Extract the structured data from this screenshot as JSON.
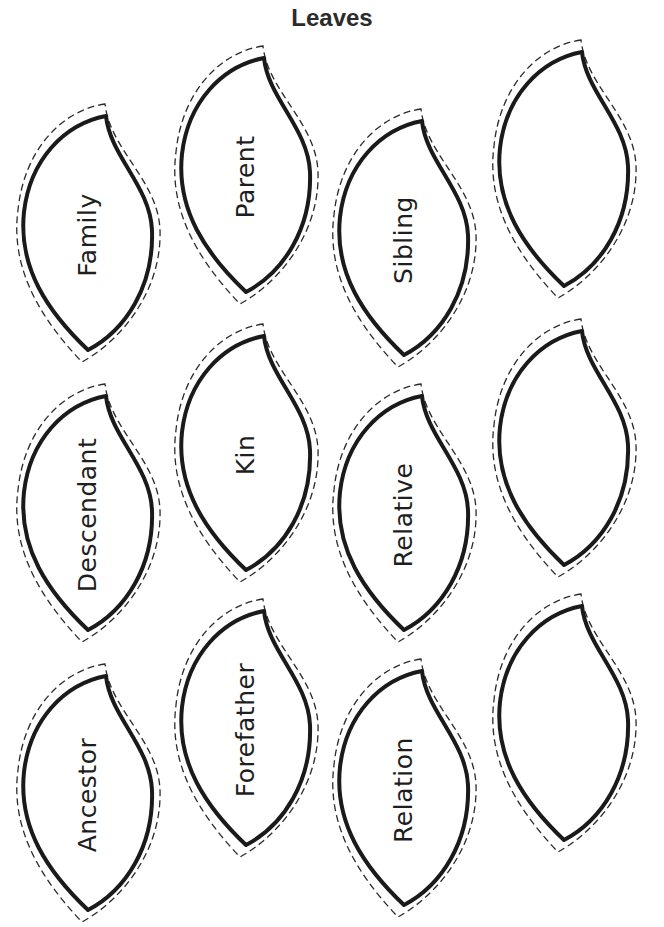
{
  "page": {
    "title": "Leaves"
  },
  "colors": {
    "outline": "#1a1a1a",
    "cut_line": "#2a2a2a",
    "background": "#ffffff"
  },
  "leaves": [
    {
      "label": "Family",
      "row": 1,
      "col": 1
    },
    {
      "label": "Parent",
      "row": 1,
      "col": 2
    },
    {
      "label": "Sibling",
      "row": 1,
      "col": 3
    },
    {
      "label": "",
      "row": 1,
      "col": 4
    },
    {
      "label": "Descendant",
      "row": 2,
      "col": 1
    },
    {
      "label": "Kin",
      "row": 2,
      "col": 2
    },
    {
      "label": "Relative",
      "row": 2,
      "col": 3
    },
    {
      "label": "",
      "row": 2,
      "col": 4
    },
    {
      "label": "Ancestor",
      "row": 3,
      "col": 1
    },
    {
      "label": "Forefather",
      "row": 3,
      "col": 2
    },
    {
      "label": "Relation",
      "row": 3,
      "col": 3
    },
    {
      "label": "",
      "row": 3,
      "col": 4
    }
  ]
}
